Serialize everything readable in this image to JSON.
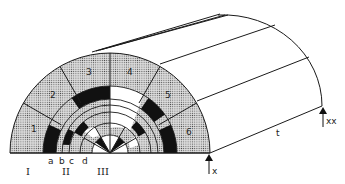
{
  "figure": {
    "colors": {
      "line": "#1a1a1a",
      "black": "#111111",
      "white": "#ffffff",
      "dotted_bg": "#d9d9d9",
      "dot": "#555555"
    },
    "geometry": {
      "front_center": [
        110,
        153
      ],
      "outer_radius": 100,
      "back_center": [
        223,
        106
      ],
      "back_rx": 99,
      "back_ry": 91
    },
    "sectors": [
      {
        "id": "1",
        "label": "1",
        "label_pos": [
          31,
          125
        ]
      },
      {
        "id": "2",
        "label": "2",
        "label_pos": [
          52,
          95
        ]
      },
      {
        "id": "3",
        "label": "3",
        "label_pos": [
          88,
          74
        ]
      },
      {
        "id": "4",
        "label": "4",
        "label_pos": [
          130,
          74
        ]
      },
      {
        "id": "5",
        "label": "5",
        "label_pos": [
          167,
          95
        ]
      },
      {
        "id": "6",
        "label": "6",
        "label_pos": [
          188,
          133
        ]
      }
    ],
    "ring_labels": [
      {
        "text": "a",
        "x": 50
      },
      {
        "text": "b",
        "x": 61
      },
      {
        "text": "c",
        "x": 71
      },
      {
        "text": "d",
        "x": 85
      }
    ],
    "zone_labels": [
      {
        "text": "I",
        "x": 30
      },
      {
        "text": "II",
        "x": 67
      },
      {
        "text": "III",
        "x": 104
      }
    ],
    "annotations": {
      "x_marker": "x",
      "xx_marker": "xx",
      "length_label": "t"
    }
  }
}
